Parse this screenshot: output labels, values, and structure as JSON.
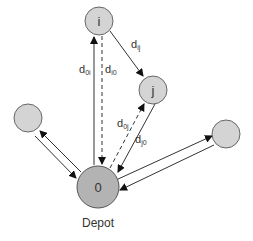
{
  "diagram": {
    "nodes": [
      {
        "id": "i",
        "label": "i"
      },
      {
        "id": "j",
        "label": "j"
      },
      {
        "id": "left",
        "label": ""
      },
      {
        "id": "right",
        "label": ""
      },
      {
        "id": "depot",
        "label": "0",
        "caption": "Depot"
      }
    ],
    "edges": [
      {
        "from": "0",
        "to": "i",
        "style": "solid",
        "label_main": "d",
        "label_sub": "0i"
      },
      {
        "from": "i",
        "to": "0",
        "style": "dashed",
        "label_main": "d",
        "label_sub": "i0"
      },
      {
        "from": "i",
        "to": "j",
        "style": "solid",
        "label_main": "d",
        "label_sub": "ij"
      },
      {
        "from": "0",
        "to": "j",
        "style": "dashed",
        "label_main": "d",
        "label_sub": "0j"
      },
      {
        "from": "j",
        "to": "0",
        "style": "solid",
        "label_main": "d",
        "label_sub": "j0"
      },
      {
        "from": "0",
        "to": "left",
        "style": "solid"
      },
      {
        "from": "left",
        "to": "0",
        "style": "solid"
      },
      {
        "from": "0",
        "to": "right",
        "style": "solid"
      },
      {
        "from": "right",
        "to": "0",
        "style": "solid"
      }
    ],
    "colors": {
      "node": "#d4d4d4",
      "depot": "#b3b3b3",
      "edge": "#333333"
    }
  }
}
